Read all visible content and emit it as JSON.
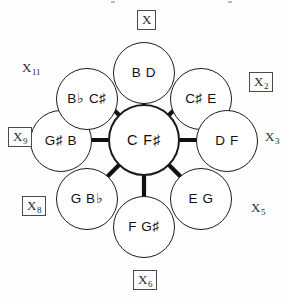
{
  "diagram": {
    "center": {
      "id": "center-node",
      "label": "C F♯"
    },
    "nodes": [
      {
        "id": "node-top",
        "label": "B D",
        "position": "top"
      },
      {
        "id": "node-upper-right",
        "label": "C♯ E",
        "position": "upper-right"
      },
      {
        "id": "node-right",
        "label": "D F",
        "position": "right"
      },
      {
        "id": "node-lower-right",
        "label": "E G",
        "position": "lower-right"
      },
      {
        "id": "node-bottom",
        "label": "F G♯",
        "position": "bottom"
      },
      {
        "id": "node-lower-left",
        "label": "G B♭",
        "position": "lower-left"
      },
      {
        "id": "node-left",
        "label": "G♯ B",
        "position": "left"
      },
      {
        "id": "node-upper-left",
        "label": "B♭ C♯",
        "position": "upper-left"
      }
    ],
    "outer_labels": [
      {
        "id": "xlabel-top",
        "base": "X",
        "sub": "",
        "boxed": true,
        "position": "top"
      },
      {
        "id": "xlabel-upper-left",
        "base": "X",
        "sub": "11",
        "boxed": false,
        "position": "upper-left"
      },
      {
        "id": "xlabel-upper-right",
        "base": "X",
        "sub": "2",
        "boxed": true,
        "position": "upper-right"
      },
      {
        "id": "xlabel-left",
        "base": "X",
        "sub": "9",
        "boxed": true,
        "position": "left"
      },
      {
        "id": "xlabel-right",
        "base": "X",
        "sub": "3",
        "boxed": false,
        "position": "right"
      },
      {
        "id": "xlabel-lower-left",
        "base": "X",
        "sub": "8",
        "boxed": true,
        "position": "lower-left"
      },
      {
        "id": "xlabel-lower-right",
        "base": "X",
        "sub": "5",
        "boxed": false,
        "position": "lower-right"
      },
      {
        "id": "xlabel-bottom",
        "base": "X",
        "sub": "6",
        "boxed": true,
        "position": "bottom"
      }
    ],
    "colors": {
      "stroke": "#1c1c1c",
      "spoke": "#111111",
      "background": "#ffffff",
      "box_border": "#4a4a4a",
      "text": "#111111"
    },
    "edges": [
      {
        "from": "center-node",
        "to": "node-top"
      },
      {
        "from": "center-node",
        "to": "node-upper-right"
      },
      {
        "from": "center-node",
        "to": "node-right"
      },
      {
        "from": "center-node",
        "to": "node-lower-right"
      },
      {
        "from": "center-node",
        "to": "node-bottom"
      },
      {
        "from": "center-node",
        "to": "node-lower-left"
      },
      {
        "from": "center-node",
        "to": "node-left"
      },
      {
        "from": "center-node",
        "to": "node-upper-left"
      }
    ]
  }
}
